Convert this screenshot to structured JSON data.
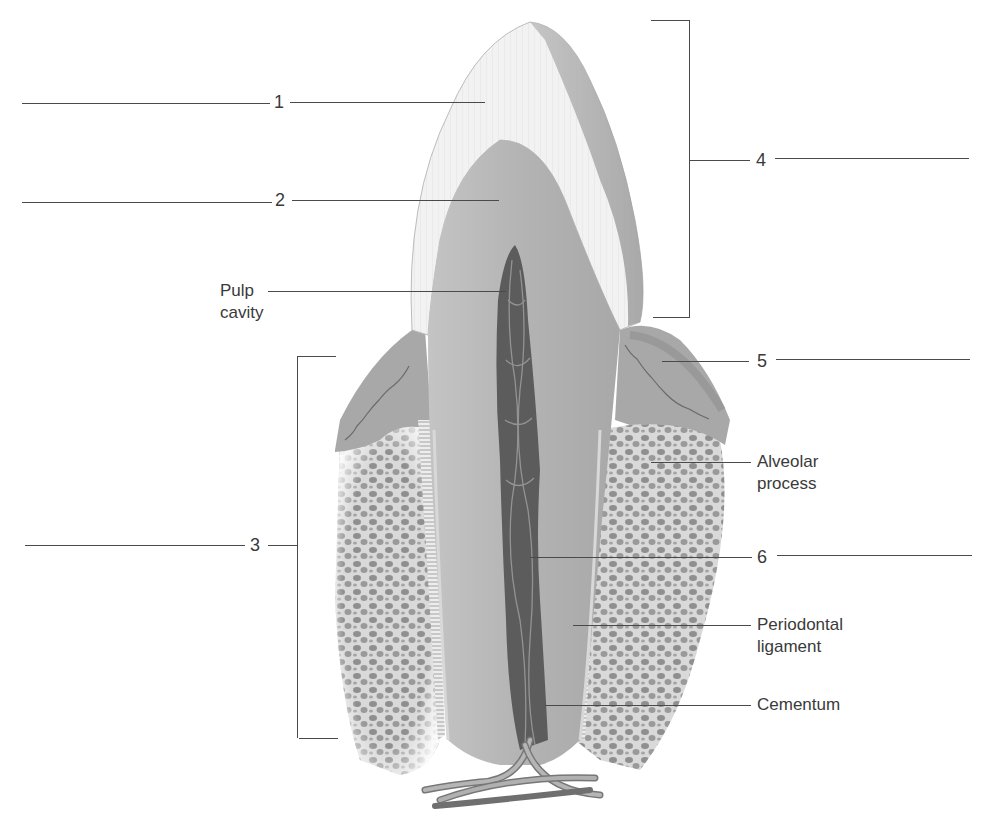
{
  "figure": {
    "colors": {
      "enamel": "#f1f1f1",
      "dentin": "#b8b8b8",
      "pulp": "#5a5a5a",
      "gingiva": "#a9a9a9",
      "bone": "#d6d6d6",
      "line": "#4a4a4a",
      "text": "#3a3a3a"
    }
  },
  "labels": {
    "numbered": [
      {
        "id": "1",
        "text": "1",
        "points_to": "enamel"
      },
      {
        "id": "2",
        "text": "2",
        "points_to": "dentin"
      },
      {
        "id": "3",
        "text": "3",
        "points_to": "root (bracket)"
      },
      {
        "id": "4",
        "text": "4",
        "points_to": "crown (bracket)"
      },
      {
        "id": "5",
        "text": "5",
        "points_to": "gingiva"
      },
      {
        "id": "6",
        "text": "6",
        "points_to": "root canal / vessels"
      }
    ],
    "named": [
      {
        "id": "pulp-cavity",
        "text": "Pulp\ncavity"
      },
      {
        "id": "alveolar-process",
        "text": "Alveolar\nprocess"
      },
      {
        "id": "periodontal-ligament",
        "text": "Periodontal\nligament"
      },
      {
        "id": "cementum",
        "text": "Cementum"
      }
    ]
  }
}
